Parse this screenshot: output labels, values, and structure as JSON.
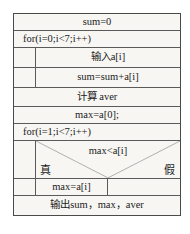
{
  "diagram": {
    "type": "nassi-shneiderman-flowchart",
    "rows": [
      {
        "id": "init-sum",
        "text": "sum=0",
        "align": "center"
      },
      {
        "id": "for-outer",
        "text": "for(i=0;i<7;i++)",
        "align": "left"
      },
      {
        "id": "input-a",
        "text": "输入a[i]",
        "align": "center"
      },
      {
        "id": "accumulate",
        "text": "sum=sum+a[i]",
        "align": "center"
      },
      {
        "id": "calc-aver",
        "text": "计算 aver",
        "align": "center"
      },
      {
        "id": "init-max",
        "text": "max=a[0];",
        "align": "center"
      },
      {
        "id": "for-second",
        "text": "for(i=1;i<7;i++)",
        "align": "left"
      }
    ],
    "condition": {
      "expression": "max<a[i]",
      "true_label": "真",
      "false_label": "假"
    },
    "branches": {
      "true_body": "max=a[i]",
      "false_body": ""
    },
    "output_row": {
      "text": "输出sum，max，aver"
    }
  },
  "colors": {
    "frame_border": "#4a4a4a",
    "line": "#5a5a5a",
    "background": "#f7f6f3",
    "text": "#1b1b1b"
  }
}
